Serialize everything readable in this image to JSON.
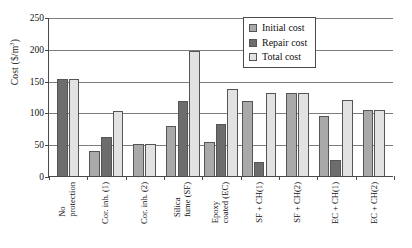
{
  "chart_data": {
    "type": "bar",
    "title": "",
    "xlabel": "",
    "ylabel": "Cost ($/m3)",
    "ylabel_display": "Cost ($/m",
    "ylabel_exponent": "3",
    "ylabel_tail": ")",
    "ylim": [
      0,
      250
    ],
    "ytick_step": 50,
    "ytick_labels": [
      "250",
      "200",
      "150",
      "100",
      "50",
      "0"
    ],
    "ytick_values": [
      250,
      200,
      150,
      100,
      50,
      0
    ],
    "grid": true,
    "legend_position": "top-right",
    "categories": [
      "No protection",
      "Cor. inh. (1)",
      "Cor. inh. (2)",
      "Silica fume (SF)",
      "Epoxy coated (EC)",
      "SF + CH(1)",
      "SF + CH(2)",
      "EC + CH(1)",
      "EC + CH(2)"
    ],
    "category_lines": [
      [
        "No",
        "protection"
      ],
      [
        "Cor. inh. (1)",
        ""
      ],
      [
        "Cor. inh. (2)",
        ""
      ],
      [
        "Silica",
        "fume (SF)"
      ],
      [
        "Epoxy",
        "coated (EC)"
      ],
      [
        "SF + CH(1)",
        ""
      ],
      [
        "SF + CH(2)",
        ""
      ],
      [
        "EC + CH(1)",
        ""
      ],
      [
        "EC + CH(2)",
        ""
      ]
    ],
    "series": [
      {
        "name": "Initial cost",
        "color": "#a9a9a9",
        "values": [
          0,
          40,
          50,
          78,
          54,
          118,
          131,
          94,
          104
        ]
      },
      {
        "name": "Repair cost",
        "color": "#6d6d6d",
        "values": [
          152,
          62,
          0,
          118,
          82,
          22,
          0,
          25,
          0
        ]
      },
      {
        "name": "Total cost",
        "color": "#e2e2e2",
        "values": [
          152,
          102,
          50,
          196,
          137,
          131,
          131,
          120,
          104
        ]
      }
    ]
  },
  "legend": {
    "items": [
      {
        "label": "Initial cost",
        "swatch_class": "initial"
      },
      {
        "label": "Repair cost",
        "swatch_class": "repair"
      },
      {
        "label": "Total cost",
        "swatch_class": "total"
      }
    ]
  }
}
